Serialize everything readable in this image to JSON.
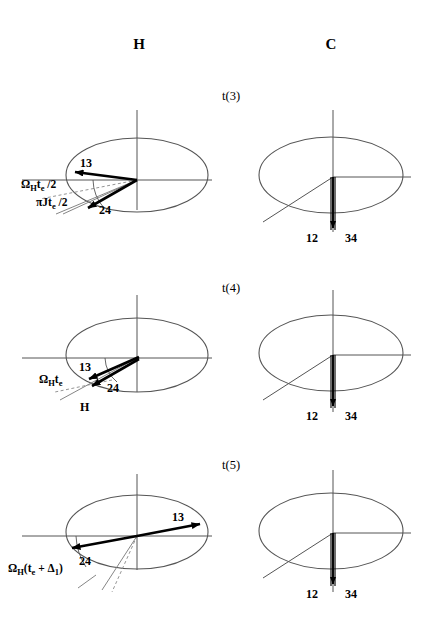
{
  "figure": {
    "title_hidden": "",
    "columns": [
      {
        "id": "H",
        "label": "H"
      },
      {
        "id": "C",
        "label": "C"
      }
    ],
    "rows": [
      {
        "time_label": "t(3)",
        "H_panel": {
          "vectors": [
            {
              "name": "13",
              "label": "13",
              "angle_deg": 188,
              "length": "long"
            },
            {
              "name": "24",
              "label": "24",
              "angle_deg": 232,
              "length": "long"
            }
          ],
          "angle_labels": [
            {
              "name": "omega-h-te-half",
              "text": "Ω",
              "sub": "H",
              "mid": "t",
              "sub2": "e",
              "tail": " /2"
            },
            {
              "name": "pi-j-te-half",
              "text": "πJt",
              "sub2": "e",
              "tail": " /2"
            }
          ]
        },
        "C_panel": {
          "vector_labels": [
            "12",
            "34"
          ],
          "direction": "down"
        }
      },
      {
        "time_label": "t(4)",
        "H_panel": {
          "vectors": [
            {
              "name": "13",
              "label": "13",
              "angle_deg": 204,
              "length": "long"
            },
            {
              "name": "24",
              "label": "24",
              "angle_deg": 208,
              "length": "long"
            }
          ],
          "angle_labels": [
            {
              "name": "omega-h-te",
              "text": "Ω",
              "sub": "H",
              "mid": "t",
              "sub2": "e",
              "tail": ""
            }
          ],
          "axis_label": "H"
        },
        "C_panel": {
          "vector_labels": [
            "12",
            "34"
          ],
          "direction": "down"
        }
      },
      {
        "time_label": "t(5)",
        "H_panel": {
          "vectors": [
            {
              "name": "13",
              "label": "13",
              "angle_deg": 14,
              "length": "long"
            },
            {
              "name": "24",
              "label": "24",
              "angle_deg": 194,
              "length": "long"
            }
          ],
          "angle_labels": [
            {
              "name": "omega-h-te-plus-delta1",
              "text": "Ω",
              "sub": "H",
              "mid": "(t",
              "sub2": "e",
              "tail": " + Δ",
              "sub3": "1",
              "close": ")"
            }
          ]
        },
        "C_panel": {
          "vector_labels": [
            "12",
            "34"
          ],
          "direction": "down"
        }
      }
    ],
    "colors": {
      "ink": "#000000",
      "axis": "#555555",
      "guide": "#777777",
      "background": "#ffffff"
    }
  }
}
